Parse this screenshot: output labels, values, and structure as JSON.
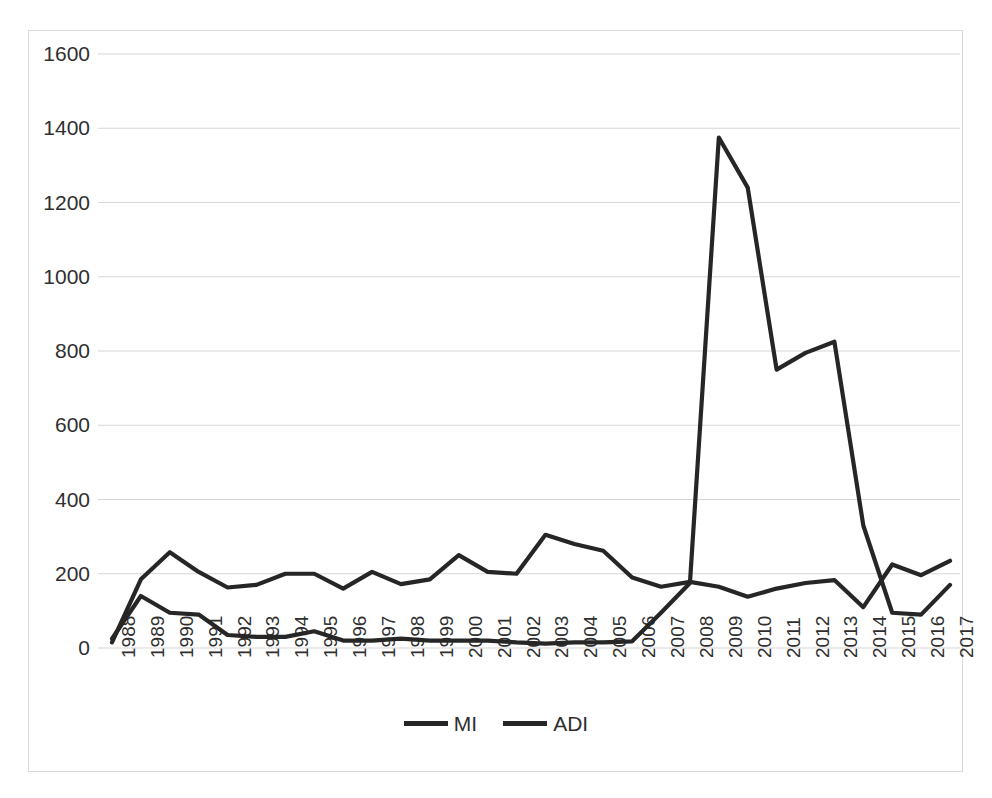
{
  "chart_data": {
    "type": "line",
    "title": "",
    "xlabel": "",
    "ylabel": "",
    "grid": true,
    "legend_position": "bottom",
    "ylim": [
      0,
      1600
    ],
    "ytick_step": 200,
    "yticks": [
      "1600",
      "1400",
      "1200",
      "1000",
      "800",
      "600",
      "400",
      "200",
      "0"
    ],
    "categories": [
      "1988",
      "1989",
      "1990",
      "1991",
      "1992",
      "1993",
      "1994",
      "1995",
      "1996",
      "1997",
      "1998",
      "1999",
      "2000",
      "2001",
      "2002",
      "2003",
      "2004",
      "2005",
      "2006",
      "2007",
      "2008",
      "2009",
      "2010",
      "2011",
      "2012",
      "2013",
      "2014",
      "2015",
      "2016",
      "2017"
    ],
    "series": [
      {
        "name": "MI",
        "color": "#262626",
        "values": [
          25,
          140,
          95,
          90,
          35,
          30,
          30,
          45,
          20,
          20,
          25,
          20,
          20,
          20,
          15,
          12,
          15,
          15,
          18,
          95,
          175,
          1375,
          1240,
          750,
          795,
          825,
          330,
          95,
          90,
          170
        ]
      },
      {
        "name": "ADI",
        "color": "#262626",
        "values": [
          15,
          185,
          258,
          205,
          163,
          170,
          200,
          200,
          160,
          205,
          172,
          185,
          250,
          205,
          200,
          305,
          280,
          262,
          190,
          165,
          178,
          165,
          138,
          160,
          175,
          183,
          110,
          225,
          196,
          235
        ]
      }
    ]
  },
  "legend": {
    "items": [
      {
        "label": "MI"
      },
      {
        "label": "ADI"
      }
    ]
  },
  "axis_geometry": {
    "plot_left": 112,
    "plot_right": 950,
    "plot_top": 54,
    "plot_bottom": 648
  }
}
